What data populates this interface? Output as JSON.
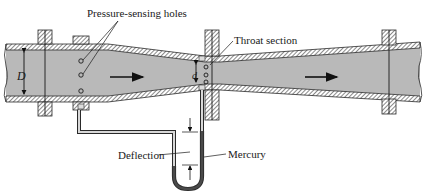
{
  "diagram": {
    "labels": {
      "pressure_holes": "Pressure-sensing holes",
      "throat": "Throat section",
      "deflection": "Deflection",
      "mercury": "Mercury",
      "inlet_diameter": "D",
      "throat_diameter": "d"
    },
    "colors": {
      "fluid": "#b9b9b9",
      "wall": "#2a2a2a",
      "mercury": "#4a4a4a",
      "background": "#ffffff"
    },
    "flow_arrows": 2,
    "manometer": "U-tube"
  }
}
